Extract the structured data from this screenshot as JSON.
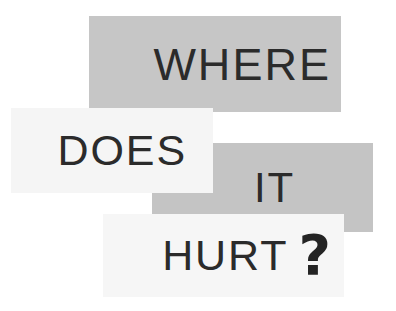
{
  "poster": {
    "message": "WHERE DOES IT HURT?",
    "background_color": "#ffffff",
    "width": 396,
    "height": 311,
    "panels": [
      {
        "id": "where",
        "text": "WHERE",
        "background_color": "#c6c6c6",
        "text_color": "#2b2b2b",
        "tone": "gray",
        "align": "right",
        "layer": 1
      },
      {
        "id": "does",
        "text": "DOES",
        "background_color": "#f5f5f5",
        "text_color": "#2b2b2b",
        "tone": "light",
        "align": "right",
        "layer": 3
      },
      {
        "id": "it",
        "text": "IT",
        "background_color": "#c4c4c4",
        "text_color": "#2b2b2b",
        "tone": "gray",
        "align": "right",
        "layer": 2
      },
      {
        "id": "hurt",
        "text": "HURT",
        "punctuation": "?",
        "background_color": "#f6f6f6",
        "text_color": "#2b2b2b",
        "punctuation_color": "#242424",
        "tone": "light",
        "align": "right",
        "layer": 4
      }
    ]
  }
}
